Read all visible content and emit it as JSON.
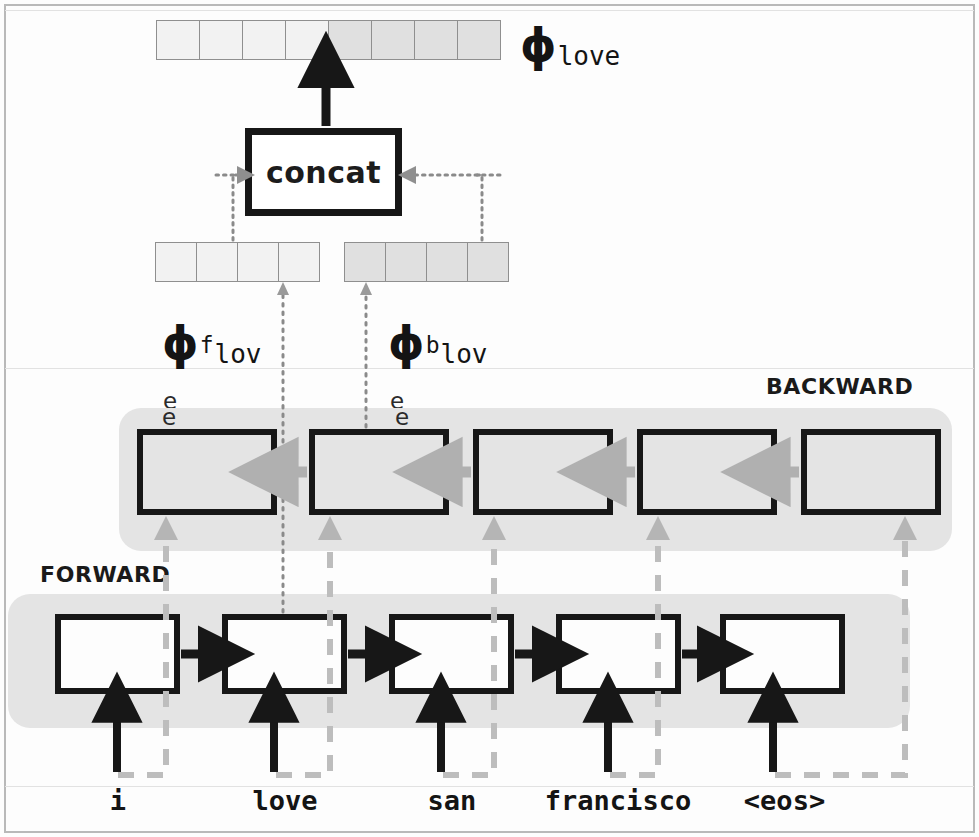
{
  "figure": {
    "type": "diagram",
    "concat_label": "concat",
    "band_forward_label": "FORWARD",
    "band_backward_label": "BACKWARD",
    "input_tokens": [
      "i",
      "love",
      "san",
      "francisco",
      "<eos>"
    ],
    "output_label": {
      "symbol": "ϕ",
      "superscript": "",
      "subscript": "love",
      "full": "ϕlove"
    },
    "forward_label": {
      "symbol": "ϕ",
      "superscript": "f",
      "subscript_line1": "lov",
      "subscript_line2": "e",
      "full": "ϕf love"
    },
    "backward_label": {
      "symbol": "ϕ",
      "superscript": "b",
      "subscript_line1": "lov",
      "subscript_line2": "e",
      "full": "ϕb love"
    },
    "vectors": {
      "combined": {
        "cells_total": 8,
        "cells_light": 4,
        "cells_dark": 4
      },
      "forward": {
        "cells": 4,
        "shade": "light"
      },
      "backward": {
        "cells": 4,
        "shade": "dark"
      }
    },
    "forward_cells": 5,
    "backward_cells": 5,
    "scan_artifact_labels": [
      "e",
      "e"
    ],
    "colors": {
      "band": "#e4e4e4",
      "cell_border": "#171717",
      "cell_backward_fill": "#e4e4e4",
      "cell_forward_fill": "#fdfdfd",
      "vector_light": "#f2f2f2",
      "vector_dark": "#e0e0e0",
      "arrow_black": "#171717",
      "arrow_gray": "#b0b0b0",
      "dotted_gray": "#8a8a8a",
      "dashed_gray": "#bdbdbd",
      "frame": "#b9b9b9"
    }
  }
}
